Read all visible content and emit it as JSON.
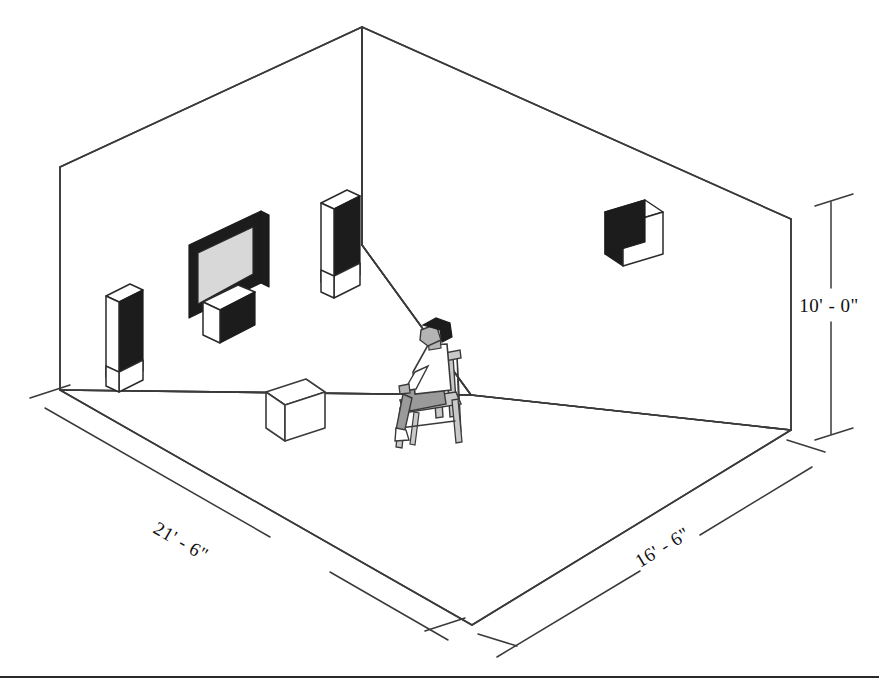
{
  "diagram": {
    "room": {
      "length_label": "21' - 6\"",
      "depth_label": "16' - 6\"",
      "height_label": "10' - 0\""
    },
    "dimensions": [
      {
        "name": "room-length",
        "label": "21' - 6\"",
        "axis": "left-front-wall"
      },
      {
        "name": "room-depth",
        "label": "16' - 6\"",
        "axis": "right-front-wall"
      },
      {
        "name": "room-height",
        "label": "10' - 0\"",
        "axis": "right-vertical"
      }
    ],
    "objects": [
      {
        "name": "television",
        "kind": "flat-panel-display",
        "wall": "back-left",
        "fill": "#d8d8d8",
        "frame": "#1c1c1c"
      },
      {
        "name": "center-channel-speaker",
        "kind": "speaker-box",
        "wall": "back-left",
        "fill": "#1c1c1c"
      },
      {
        "name": "front-left-tower-speaker",
        "kind": "tower-speaker",
        "wall": "back-left",
        "fill": "#1c1c1c"
      },
      {
        "name": "front-right-tower-speaker",
        "kind": "tower-speaker",
        "wall": "back-left",
        "fill": "#1c1c1c"
      },
      {
        "name": "surround-right-speaker",
        "kind": "speaker-box",
        "wall": "back-right",
        "fill": "#1c1c1c"
      },
      {
        "name": "subwoofer",
        "kind": "floor-box",
        "wall": "floor",
        "fill": "#ffffff"
      },
      {
        "name": "seated-listener",
        "kind": "person-in-chair",
        "wall": "floor"
      }
    ],
    "colors": {
      "line": "#3a3a3a",
      "speaker_fill": "#1c1c1c",
      "screen_fill": "#d8d8d8",
      "skin": "#b4b4b4",
      "shirt": "#ffffff",
      "pants": "#9a9a9a",
      "chair": "#c9c9c9",
      "hair": "#1c1c1c"
    },
    "caption": ""
  }
}
